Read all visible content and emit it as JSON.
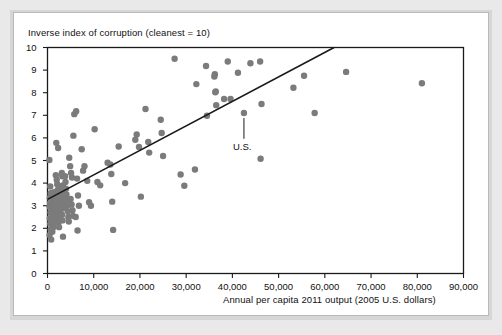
{
  "figure": {
    "kind": "scatter-plot-figure",
    "background_color": "#e9e9e9",
    "card_color": "#ffffff"
  },
  "chart_data": {
    "type": "scatter",
    "title": "",
    "ylabel": "Inverse index of corruption (cleanest = 10)",
    "xlabel": "Annual per capita 2011 output (2005 U.S. dollars)",
    "xlim": [
      0,
      90000
    ],
    "ylim": [
      0,
      10
    ],
    "xticks": [
      0,
      10000,
      20000,
      30000,
      40000,
      50000,
      60000,
      70000,
      80000,
      90000
    ],
    "xtick_labels": [
      "0",
      "10,000",
      "20,000",
      "30,000",
      "40,000",
      "50,000",
      "60,000",
      "70,000",
      "80,000",
      "90,000"
    ],
    "yticks": [
      0,
      1,
      2,
      3,
      4,
      5,
      6,
      7,
      8,
      9,
      10
    ],
    "ytick_labels": [
      "0",
      "1",
      "2",
      "3",
      "4",
      "5",
      "6",
      "7",
      "8",
      "9",
      "10"
    ],
    "grid": false,
    "legend": null,
    "marker_color": "#7b7b7b",
    "marker_size": 4.4,
    "trendline": {
      "label": "linear fit",
      "color": "#1a1a1a",
      "width": 1.6,
      "x_start": 0,
      "y_start": 3.28,
      "x_end": 62000,
      "y_end": 10.0
    },
    "annotations": [
      {
        "text": "U.S.",
        "point_x": 42500,
        "point_y": 7.1,
        "label_x": 42500,
        "label_y": 6.05,
        "leader": true
      }
    ],
    "points": [
      [
        400,
        5.02
      ],
      [
        600,
        3.85
      ],
      [
        700,
        3.55
      ],
      [
        500,
        3.35
      ],
      [
        550,
        3.1
      ],
      [
        450,
        2.95
      ],
      [
        650,
        2.7
      ],
      [
        500,
        2.45
      ],
      [
        600,
        2.2
      ],
      [
        700,
        1.95
      ],
      [
        450,
        1.7
      ],
      [
        800,
        1.5
      ],
      [
        900,
        3.45
      ],
      [
        1000,
        3.2
      ],
      [
        1100,
        2.9
      ],
      [
        1200,
        2.65
      ],
      [
        1300,
        2.4
      ],
      [
        1150,
        2.15
      ],
      [
        1050,
        1.85
      ],
      [
        1400,
        3.6
      ],
      [
        1500,
        3.3
      ],
      [
        1600,
        3.05
      ],
      [
        1700,
        2.8
      ],
      [
        1450,
        2.55
      ],
      [
        1350,
        2.3
      ],
      [
        1250,
        2.05
      ],
      [
        1900,
        5.78
      ],
      [
        2300,
        5.55
      ],
      [
        1800,
        4.35
      ],
      [
        2000,
        4.15
      ],
      [
        2100,
        3.95
      ],
      [
        2200,
        3.7
      ],
      [
        1950,
        3.45
      ],
      [
        2050,
        3.2
      ],
      [
        2150,
        2.95
      ],
      [
        2250,
        2.7
      ],
      [
        2400,
        2.45
      ],
      [
        2350,
        2.25
      ],
      [
        2500,
        2.05
      ],
      [
        2600,
        3.8
      ],
      [
        2700,
        3.55
      ],
      [
        2800,
        3.3
      ],
      [
        2900,
        3.05
      ],
      [
        3000,
        2.85
      ],
      [
        2750,
        2.6
      ],
      [
        2650,
        2.35
      ],
      [
        3100,
        4.45
      ],
      [
        3200,
        4.3
      ],
      [
        3300,
        3.9
      ],
      [
        3400,
        3.65
      ],
      [
        3500,
        3.4
      ],
      [
        3600,
        3.15
      ],
      [
        3700,
        2.9
      ],
      [
        3150,
        2.6
      ],
      [
        3250,
        2.35
      ],
      [
        3350,
        1.63
      ],
      [
        3800,
        4.3
      ],
      [
        3900,
        4.05
      ],
      [
        4000,
        3.75
      ],
      [
        4100,
        3.5
      ],
      [
        4200,
        3.25
      ],
      [
        4300,
        3.0
      ],
      [
        4400,
        2.75
      ],
      [
        4500,
        2.5
      ],
      [
        4600,
        2.3
      ],
      [
        4700,
        5.12
      ],
      [
        4900,
        4.75
      ],
      [
        5100,
        4.45
      ],
      [
        5300,
        4.25
      ],
      [
        5000,
        3.3
      ],
      [
        5200,
        3.05
      ],
      [
        5400,
        2.8
      ],
      [
        5500,
        2.55
      ],
      [
        5600,
        6.1
      ],
      [
        5800,
        7.05
      ],
      [
        6200,
        7.18
      ],
      [
        6400,
        4.2
      ],
      [
        6600,
        3.45
      ],
      [
        6800,
        3.0
      ],
      [
        6100,
        2.5
      ],
      [
        6500,
        1.9
      ],
      [
        7400,
        5.5
      ],
      [
        7700,
        4.55
      ],
      [
        8000,
        4.75
      ],
      [
        8600,
        4.1
      ],
      [
        9000,
        3.15
      ],
      [
        9400,
        3.0
      ],
      [
        10200,
        6.38
      ],
      [
        10800,
        4.05
      ],
      [
        11400,
        3.9
      ],
      [
        13000,
        4.9
      ],
      [
        13600,
        4.82
      ],
      [
        13800,
        4.4
      ],
      [
        14000,
        3.18
      ],
      [
        14200,
        1.93
      ],
      [
        15400,
        5.62
      ],
      [
        16800,
        4.0
      ],
      [
        19000,
        5.92
      ],
      [
        19300,
        6.15
      ],
      [
        19800,
        5.6
      ],
      [
        20200,
        3.4
      ],
      [
        21200,
        7.28
      ],
      [
        21800,
        5.82
      ],
      [
        22000,
        5.35
      ],
      [
        24700,
        6.22
      ],
      [
        24500,
        6.8
      ],
      [
        25000,
        5.2
      ],
      [
        27500,
        9.5
      ],
      [
        28800,
        4.38
      ],
      [
        29600,
        3.88
      ],
      [
        31900,
        4.6
      ],
      [
        32200,
        8.38
      ],
      [
        34300,
        9.18
      ],
      [
        34500,
        6.98
      ],
      [
        36200,
        8.82
      ],
      [
        36400,
        8.05
      ],
      [
        36300,
        8.02
      ],
      [
        36500,
        7.45
      ],
      [
        36100,
        8.72
      ],
      [
        38200,
        7.72
      ],
      [
        39000,
        9.38
      ],
      [
        39600,
        7.72
      ],
      [
        41200,
        8.88
      ],
      [
        42500,
        7.1
      ],
      [
        43900,
        9.3
      ],
      [
        46000,
        9.38
      ],
      [
        46300,
        7.5
      ],
      [
        46100,
        5.08
      ],
      [
        53200,
        8.22
      ],
      [
        55500,
        8.75
      ],
      [
        57800,
        7.1
      ],
      [
        64600,
        8.92
      ],
      [
        81000,
        8.42
      ]
    ]
  }
}
